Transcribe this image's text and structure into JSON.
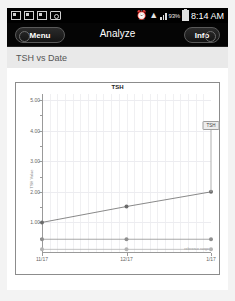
{
  "statusbar": {
    "icons": [
      "screenshot-icon",
      "screenshot-icon",
      "screenshot-icon",
      "camera-icon",
      "alarm-icon",
      "wifi-icon",
      "signal-icon"
    ],
    "alarm_glyph": "⏰",
    "wifi_glyph": "▲",
    "battery_percent": "93%",
    "time": "8:14 AM"
  },
  "navbar": {
    "menu_label": "Menu",
    "title": "Analyze",
    "info_label": "Info"
  },
  "section": {
    "header": "TSH vs Date"
  },
  "callout": {
    "label": "TSH"
  },
  "colors": {
    "statusbar_bg": "#000000",
    "navbar_bg": "#050505",
    "section_bg": "#e9e9e9",
    "page_bg": "#f3f3f3",
    "card_bg": "#ffffff",
    "series_tsh": "#6b6b6b",
    "series_ref_high": "#8f8f8f",
    "series_ref_low": "#b4b4b4",
    "axis": "#9a9a9a",
    "grid": "#f0f0f2"
  },
  "chart_data": {
    "type": "line",
    "title": "TSH",
    "xlabel": "",
    "ylabel": "TSH Value",
    "x": [
      "11/17",
      "12/17",
      "1/17"
    ],
    "xtick_labels": [
      "11/17",
      "12/17",
      "1/17"
    ],
    "ytick_labels": [
      "5.00",
      "4.00",
      "3.00",
      "2.00",
      "1.00"
    ],
    "ytick_values": [
      5.0,
      4.0,
      3.0,
      2.0,
      1.0
    ],
    "yminor_values": [
      4.5,
      3.5,
      2.5,
      1.5,
      0.5
    ],
    "ylim": [
      0.0,
      5.2
    ],
    "grid": true,
    "legend": "none",
    "annotation": {
      "label": "TSH",
      "x_index": 2,
      "y": 2.0
    },
    "inline_note": "reference range",
    "series": [
      {
        "name": "TSH",
        "values": [
          1.0,
          1.52,
          2.0
        ],
        "color": "#6b6b6b",
        "markers": true
      },
      {
        "name": "Reference High",
        "values": [
          0.45,
          0.45,
          0.45
        ],
        "color": "#8f8f8f",
        "markers": true
      },
      {
        "name": "Reference Low",
        "values": [
          0.12,
          0.12,
          0.12
        ],
        "color": "#b4b4b4",
        "markers": true
      }
    ]
  }
}
